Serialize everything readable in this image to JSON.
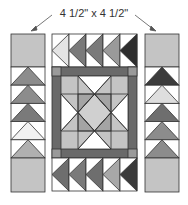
{
  "dimension_label": "4 1/2\" x 4 1/2\"",
  "colors": {
    "outline": "#333333",
    "square_fill": "#c4c4c4",
    "border_dark": "#6a6a6a",
    "corner": "#9a9a9a",
    "white": "#ffffff"
  },
  "left_column": {
    "geese_fills": [
      "#8c8c8c",
      "#8c8c8c",
      "#7a7a7a",
      "#f2f2f2",
      "#b0b0b0"
    ]
  },
  "right_column": {
    "geese_fills": [
      "#3c3c3c",
      "#dedede",
      "#6e6e6e",
      "#8c8c8c",
      "#8c8c8c"
    ]
  },
  "top_row": {
    "geese_fills": [
      "#e4e4e4",
      "#7a7a7a",
      "#7a7a7a",
      "#9a9a9a",
      "#2e2e2e"
    ]
  },
  "bottom_row": {
    "geese_fills": [
      "#6e6e6e",
      "#7a7a7a",
      "#6e6e6e",
      "#a8a8a8",
      "#3a3a3a"
    ]
  }
}
